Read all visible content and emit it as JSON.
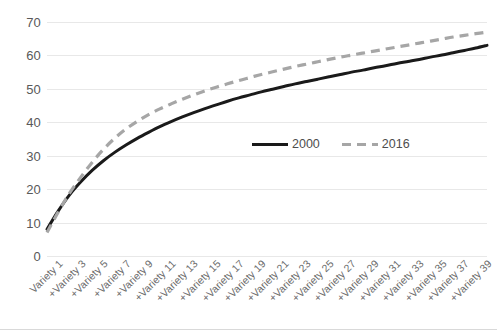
{
  "chart_data": {
    "type": "line",
    "title": "",
    "subtitle": "",
    "xlabel": "",
    "ylabel": "",
    "grid": true,
    "legend_position": "center-right-inside",
    "ylim": [
      0,
      70
    ],
    "ytick_labels": [
      "0",
      "10",
      "20",
      "30",
      "40",
      "50",
      "60",
      "70"
    ],
    "ytick_values": [
      0,
      10,
      20,
      30,
      40,
      50,
      60,
      70
    ],
    "categories": [
      "Variety 1",
      "+Variety 2",
      "+Variety 3",
      "+Variety 4",
      "+Variety 5",
      "+Variety 6",
      "+Variety 7",
      "+Variety 8",
      "+Variety 9",
      "+Variety 10",
      "+Variety 11",
      "+Variety 12",
      "+Variety 13",
      "+Variety 14",
      "+Variety 15",
      "+Variety 16",
      "+Variety 17",
      "+Variety 18",
      "+Variety 19",
      "+Variety 20",
      "+Variety 21",
      "+Variety 22",
      "+Variety 23",
      "+Variety 24",
      "+Variety 25",
      "+Variety 26",
      "+Variety 27",
      "+Variety 28",
      "+Variety 29",
      "+Variety 30",
      "+Variety 31",
      "+Variety 32",
      "+Variety 33",
      "+Variety 34",
      "+Variety 35",
      "+Variety 36",
      "+Variety 37",
      "+Variety 38",
      "+Variety 39",
      "+Variety 40"
    ],
    "xtick_labels_shown": [
      "Variety 1",
      "+Variety 3",
      "+Variety 5",
      "+Variety 7",
      "+Variety 9",
      "+Variety 11",
      "+Variety 13",
      "+Variety 15",
      "+Variety 17",
      "+Variety 19",
      "+Variety 21",
      "+Variety 23",
      "+Variety 25",
      "+Variety 27",
      "+Variety 29",
      "+Variety 31",
      "+Variety 33",
      "+Variety 35",
      "+Variety 37",
      "+Variety 39"
    ],
    "series": [
      {
        "name": "2000",
        "color": "#1a1a1a",
        "style": "solid",
        "values": [
          8.0,
          13.5,
          18.3,
          22.2,
          25.6,
          28.5,
          31.0,
          33.2,
          35.2,
          37.0,
          38.7,
          40.2,
          41.6,
          42.9,
          44.1,
          45.2,
          46.3,
          47.3,
          48.2,
          49.1,
          49.9,
          50.7,
          51.5,
          52.2,
          52.9,
          53.6,
          54.3,
          55.0,
          55.6,
          56.3,
          56.9,
          57.6,
          58.2,
          58.8,
          59.5,
          60.1,
          60.8,
          61.5,
          62.2,
          63.0
        ]
      },
      {
        "name": "2016",
        "color": "#a6a6a6",
        "style": "dashed",
        "values": [
          7.0,
          13.2,
          18.8,
          23.6,
          28.0,
          31.9,
          35.2,
          38.0,
          40.3,
          42.3,
          44.0,
          45.5,
          46.9,
          48.2,
          49.4,
          50.5,
          51.5,
          52.5,
          53.4,
          54.3,
          55.1,
          55.9,
          56.7,
          57.4,
          58.1,
          58.8,
          59.5,
          60.1,
          60.7,
          61.3,
          61.9,
          62.5,
          63.1,
          63.7,
          64.3,
          64.9,
          65.5,
          66.0,
          66.5,
          67.0
        ]
      }
    ],
    "legend": [
      {
        "label": "2000",
        "color": "#1a1a1a",
        "style": "solid"
      },
      {
        "label": "2016",
        "color": "#a6a6a6",
        "style": "dashed"
      }
    ]
  }
}
